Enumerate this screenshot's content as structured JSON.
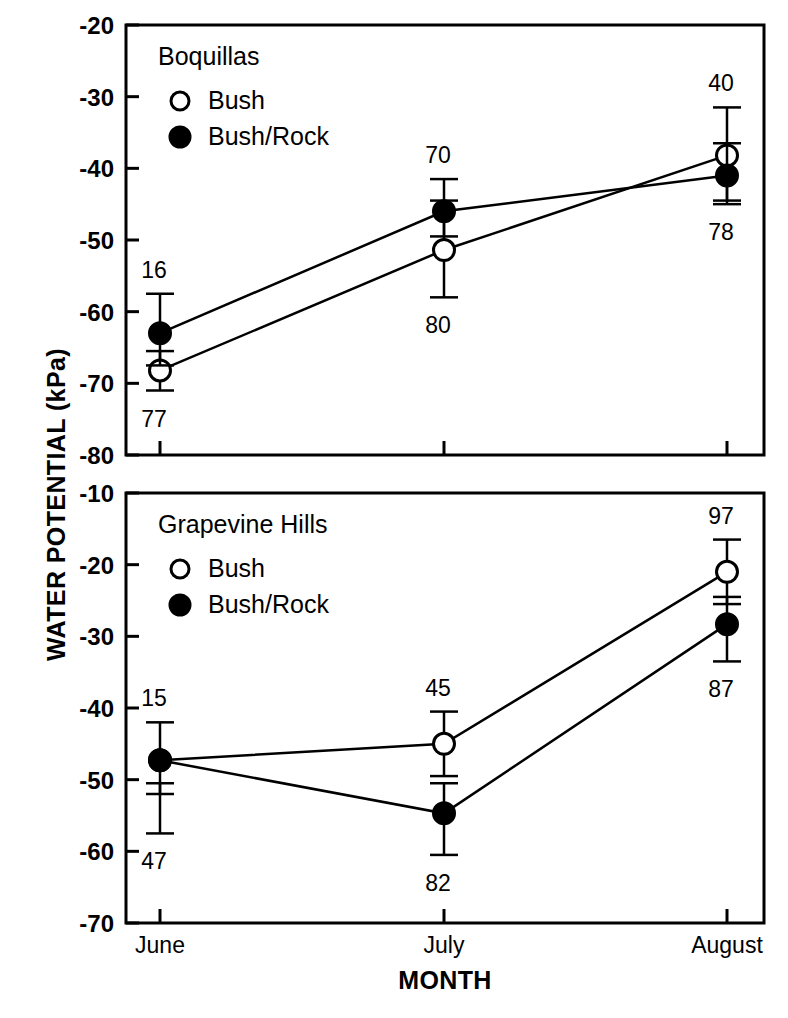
{
  "figure": {
    "ylabel": "WATER POTENTIAL (kPa)",
    "xlabel": "MONTH",
    "categories": [
      "June",
      "July",
      "August"
    ],
    "series_names": [
      "Bush",
      "Bush/Rock"
    ]
  },
  "chart_data": [
    {
      "type": "line",
      "title": "Boquillas",
      "panel": "top",
      "xlabel": "MONTH",
      "ylabel": "WATER POTENTIAL (kPa)",
      "categories": [
        "June",
        "July",
        "August"
      ],
      "ylim": [
        -80,
        -20
      ],
      "yticks": [
        -20,
        -30,
        -40,
        -50,
        -60,
        -70,
        -80
      ],
      "ytick_labels": [
        "-20",
        "-30",
        "-40",
        "-50",
        "-60",
        "-70",
        "-80"
      ],
      "grid": false,
      "legend_position": "top-left",
      "series": [
        {
          "name": "Bush",
          "marker": "open-circle",
          "values": [
            -68.2,
            -51.4,
            -38.2
          ],
          "err_low": [
            -71.0,
            -58.0,
            -44.5
          ],
          "err_high": [
            -65.5,
            -44.5,
            -31.5
          ],
          "point_labels": [
            "77",
            "80",
            "40"
          ],
          "label_positions": [
            "below",
            "below",
            "above"
          ]
        },
        {
          "name": "Bush/Rock",
          "marker": "filled-circle",
          "values": [
            -63.0,
            -46.0,
            -41.0
          ],
          "err_low": [
            -67.5,
            -49.5,
            -45.0
          ],
          "err_high": [
            -57.5,
            -41.5,
            -36.5
          ],
          "point_labels": [
            "16",
            "70",
            "78"
          ],
          "label_positions": [
            "above",
            "above",
            "below"
          ]
        }
      ]
    },
    {
      "type": "line",
      "title": "Grapevine Hills",
      "panel": "bottom",
      "xlabel": "MONTH",
      "ylabel": "WATER POTENTIAL (kPa)",
      "categories": [
        "June",
        "July",
        "August"
      ],
      "ylim": [
        -70,
        -10
      ],
      "yticks": [
        -10,
        -20,
        -30,
        -40,
        -50,
        -60,
        -70
      ],
      "ytick_labels": [
        "-10",
        "-20",
        "-30",
        "-40",
        "-50",
        "-60",
        "-70"
      ],
      "grid": false,
      "legend_position": "top-left",
      "series": [
        {
          "name": "Bush",
          "marker": "open-circle",
          "values": [
            -47.3,
            -45.0,
            -21.0
          ],
          "err_low": [
            -52.0,
            -49.5,
            -25.5
          ],
          "err_high": [
            -42.0,
            -40.5,
            -16.5
          ],
          "point_labels": [
            "15",
            "45",
            "97"
          ],
          "label_positions": [
            "above",
            "above",
            "above"
          ]
        },
        {
          "name": "Bush/Rock",
          "marker": "filled-circle",
          "values": [
            -47.3,
            -54.7,
            -28.3
          ],
          "err_low": [
            -57.5,
            -60.5,
            -33.5
          ],
          "err_high": [
            -50.5,
            -50.5,
            -24.5
          ],
          "point_labels": [
            "47",
            "82",
            "87"
          ],
          "label_positions": [
            "below",
            "below",
            "below"
          ]
        }
      ]
    }
  ],
  "panels": {
    "top": {
      "title": "Boquillas",
      "legend": [
        {
          "marker": "open-circle",
          "label": "Bush"
        },
        {
          "marker": "filled-circle",
          "label": "Bush/Rock"
        }
      ],
      "ytick_labels": [
        "-20",
        "-30",
        "-40",
        "-50",
        "-60",
        "-70",
        "-80"
      ],
      "point_labels": [
        "16",
        "70",
        "40",
        "77",
        "80",
        "78"
      ]
    },
    "bottom": {
      "title": "Grapevine Hills",
      "legend": [
        {
          "marker": "open-circle",
          "label": "Bush"
        },
        {
          "marker": "filled-circle",
          "label": "Bush/Rock"
        }
      ],
      "ytick_labels": [
        "-10",
        "-20",
        "-30",
        "-40",
        "-50",
        "-60",
        "-70"
      ],
      "point_labels": [
        "15",
        "45",
        "97",
        "47",
        "82",
        "87"
      ],
      "xtick_labels": [
        "June",
        "July",
        "August"
      ]
    }
  },
  "colors": {
    "ink": "#000000",
    "paper": "#ffffff"
  }
}
